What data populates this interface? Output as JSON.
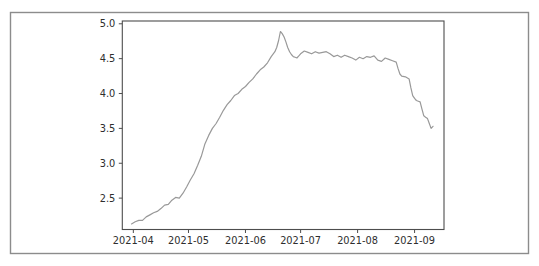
{
  "figure": {
    "frame_color": "#8c8c8c",
    "plot_background": "#ffffff"
  },
  "chart_data": {
    "type": "line",
    "title": "",
    "xlabel": "",
    "ylabel": "",
    "grid": false,
    "legend": null,
    "line_color": "#999999",
    "axis_color": "#4d4d4d",
    "tick_label_color": "#2e2e2e",
    "x_domain": [
      "2021-03-26",
      "2021-09-17"
    ],
    "ylim": [
      2.05,
      5.04
    ],
    "xticks": [
      {
        "date": "2021-04-01",
        "label": "2021-04"
      },
      {
        "date": "2021-05-01",
        "label": "2021-05"
      },
      {
        "date": "2021-06-01",
        "label": "2021-06"
      },
      {
        "date": "2021-07-01",
        "label": "2021-07"
      },
      {
        "date": "2021-08-01",
        "label": "2021-08"
      },
      {
        "date": "2021-09-01",
        "label": "2021-09"
      }
    ],
    "yticks": [
      {
        "value": 2.5,
        "label": "2.5"
      },
      {
        "value": 3.0,
        "label": "3.0"
      },
      {
        "value": 3.5,
        "label": "3.5"
      },
      {
        "value": 4.0,
        "label": "4.0"
      },
      {
        "value": 4.5,
        "label": "4.5"
      },
      {
        "value": 5.0,
        "label": "5.0"
      }
    ],
    "x": [
      "2021-03-31",
      "2021-04-02",
      "2021-04-04",
      "2021-04-06",
      "2021-04-08",
      "2021-04-10",
      "2021-04-12",
      "2021-04-14",
      "2021-04-16",
      "2021-04-18",
      "2021-04-20",
      "2021-04-22",
      "2021-04-24",
      "2021-04-26",
      "2021-04-28",
      "2021-04-30",
      "2021-05-02",
      "2021-05-04",
      "2021-05-06",
      "2021-05-08",
      "2021-05-10",
      "2021-05-12",
      "2021-05-14",
      "2021-05-16",
      "2021-05-18",
      "2021-05-20",
      "2021-05-22",
      "2021-05-24",
      "2021-05-26",
      "2021-05-28",
      "2021-05-30",
      "2021-06-01",
      "2021-06-03",
      "2021-06-05",
      "2021-06-07",
      "2021-06-09",
      "2021-06-11",
      "2021-06-13",
      "2021-06-15",
      "2021-06-17",
      "2021-06-18",
      "2021-06-19",
      "2021-06-20",
      "2021-06-21",
      "2021-06-22",
      "2021-06-23",
      "2021-06-24",
      "2021-06-25",
      "2021-06-26",
      "2021-06-27",
      "2021-06-28",
      "2021-06-29",
      "2021-06-30",
      "2021-07-01",
      "2021-07-03",
      "2021-07-05",
      "2021-07-07",
      "2021-07-09",
      "2021-07-11",
      "2021-07-13",
      "2021-07-15",
      "2021-07-17",
      "2021-07-19",
      "2021-07-21",
      "2021-07-23",
      "2021-07-25",
      "2021-07-27",
      "2021-07-29",
      "2021-07-31",
      "2021-08-02",
      "2021-08-04",
      "2021-08-06",
      "2021-08-08",
      "2021-08-10",
      "2021-08-12",
      "2021-08-14",
      "2021-08-16",
      "2021-08-18",
      "2021-08-20",
      "2021-08-22",
      "2021-08-23",
      "2021-08-24",
      "2021-08-25",
      "2021-08-27",
      "2021-08-29",
      "2021-08-30",
      "2021-08-31",
      "2021-09-01",
      "2021-09-02",
      "2021-09-03",
      "2021-09-04",
      "2021-09-05",
      "2021-09-06",
      "2021-09-07",
      "2021-09-08",
      "2021-09-09",
      "2021-09-10",
      "2021-09-11"
    ],
    "y": [
      2.13,
      2.16,
      2.18,
      2.18,
      2.23,
      2.26,
      2.29,
      2.31,
      2.35,
      2.4,
      2.41,
      2.47,
      2.51,
      2.5,
      2.57,
      2.66,
      2.76,
      2.85,
      2.97,
      3.1,
      3.28,
      3.4,
      3.5,
      3.57,
      3.66,
      3.76,
      3.84,
      3.9,
      3.97,
      4.0,
      4.06,
      4.1,
      4.16,
      4.21,
      4.28,
      4.34,
      4.38,
      4.44,
      4.53,
      4.6,
      4.66,
      4.76,
      4.89,
      4.86,
      4.81,
      4.74,
      4.66,
      4.6,
      4.56,
      4.53,
      4.52,
      4.51,
      4.54,
      4.57,
      4.61,
      4.59,
      4.57,
      4.6,
      4.58,
      4.59,
      4.6,
      4.57,
      4.53,
      4.55,
      4.52,
      4.55,
      4.53,
      4.51,
      4.48,
      4.52,
      4.5,
      4.53,
      4.52,
      4.54,
      4.48,
      4.46,
      4.51,
      4.49,
      4.47,
      4.45,
      4.36,
      4.28,
      4.25,
      4.24,
      4.21,
      4.08,
      3.97,
      3.93,
      3.9,
      3.89,
      3.88,
      3.78,
      3.68,
      3.66,
      3.64,
      3.57,
      3.5,
      3.53
    ]
  }
}
